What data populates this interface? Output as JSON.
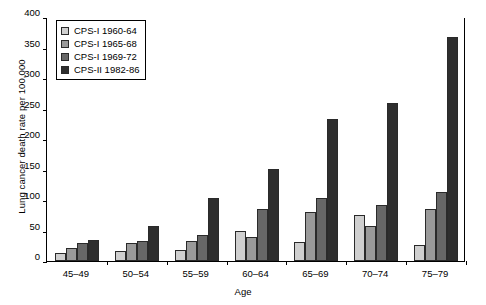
{
  "chart_data": {
    "type": "bar",
    "title": "",
    "xlabel": "Age",
    "ylabel": "Lung cancer death rate per 100,000",
    "categories": [
      "45–49",
      "50–54",
      "55–59",
      "60–64",
      "65–69",
      "70–74",
      "75–79"
    ],
    "series": [
      {
        "name": "CPS-I 1960-64",
        "color": "#cfcfcf",
        "values": [
          13,
          17,
          18,
          50,
          31,
          75,
          27
        ]
      },
      {
        "name": "CPS-I 1965-68",
        "color": "#9a9a9a",
        "values": [
          21,
          30,
          33,
          39,
          80,
          57,
          86
        ]
      },
      {
        "name": "CPS-I 1969-72",
        "color": "#676767",
        "values": [
          30,
          33,
          42,
          86,
          103,
          92,
          113
        ]
      },
      {
        "name": "CPS-II 1982-86",
        "color": "#2e2e2e",
        "values": [
          34,
          57,
          104,
          151,
          232,
          259,
          367
        ]
      }
    ],
    "ylim": [
      0,
      400
    ],
    "yticks": [
      0,
      50,
      100,
      150,
      200,
      250,
      300,
      350,
      400
    ],
    "ytick_labels": [
      "0",
      "50",
      "100",
      "150",
      "200",
      "250",
      "300",
      "350",
      "400"
    ],
    "grid": false,
    "legend_position": "top-left"
  }
}
